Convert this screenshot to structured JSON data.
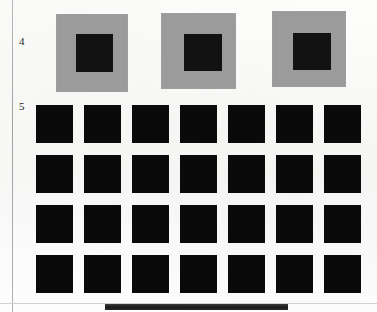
{
  "page": {
    "background_color": "#fbfbfa",
    "width": 377,
    "height": 312,
    "left_rule_color": "#a8a8a8",
    "foot_bar_color": "#1b1b1b"
  },
  "figures": [
    {
      "label": "4",
      "type": "gray-patch-row",
      "patch_color": "#9b9b9b",
      "inner_color": "#121212",
      "count": 3,
      "patches": [
        {
          "x": 56,
          "y": 14,
          "w": 72,
          "h": 78,
          "inner_x": 20,
          "inner_y": 20,
          "inner_w": 37,
          "inner_h": 38
        },
        {
          "x": 161,
          "y": 13,
          "w": 75,
          "h": 76,
          "inner_x": 23,
          "inner_y": 21,
          "inner_w": 38,
          "inner_h": 37
        },
        {
          "x": 272,
          "y": 11,
          "w": 74,
          "h": 76,
          "inner_x": 21,
          "inner_y": 22,
          "inner_w": 38,
          "inner_h": 37
        }
      ]
    },
    {
      "label": "5",
      "type": "black-square-grid",
      "square_color": "#0a0a0a",
      "columns": 7,
      "rows": 4,
      "square_width": 37,
      "square_height": 38,
      "column_gap": 11,
      "row_gap": 12,
      "total_squares": 28
    }
  ]
}
